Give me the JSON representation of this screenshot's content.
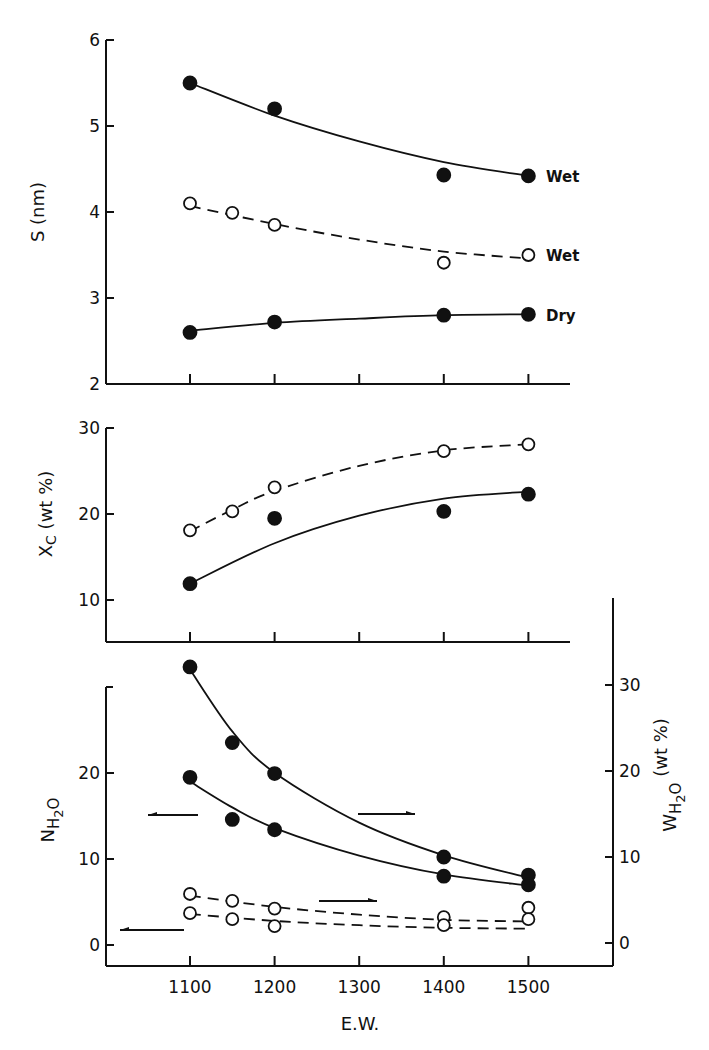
{
  "chart_data": [
    {
      "id": "panel-s",
      "type": "scatter",
      "title": "",
      "xlabel": "",
      "ylabel": "S (nm)",
      "xlim": [
        1000,
        1570
      ],
      "ylim": [
        2,
        6
      ],
      "x_ticks": [
        1100,
        1200,
        1300,
        1400,
        1500
      ],
      "y_ticks": [
        2,
        3,
        4,
        5,
        6
      ],
      "grid": false,
      "legend": "inline labels at right end of curves",
      "series": [
        {
          "name": "Wet (filled)",
          "label": "Wet",
          "marker": "filled-circle",
          "line": "solid",
          "x": [
            1100,
            1200,
            1400,
            1500
          ],
          "y": [
            5.5,
            5.2,
            4.43,
            4.42
          ],
          "fit": [
            [
              1100,
              5.5
            ],
            [
              1200,
              5.12
            ],
            [
              1300,
              4.82
            ],
            [
              1400,
              4.58
            ],
            [
              1500,
              4.42
            ]
          ]
        },
        {
          "name": "Wet (open)",
          "label": "Wet",
          "marker": "open-circle",
          "line": "dashed",
          "x": [
            1100,
            1150,
            1200,
            1400,
            1500
          ],
          "y": [
            4.1,
            3.99,
            3.85,
            3.41,
            3.5
          ],
          "fit": [
            [
              1100,
              4.07
            ],
            [
              1200,
              3.86
            ],
            [
              1300,
              3.68
            ],
            [
              1400,
              3.54
            ],
            [
              1500,
              3.46
            ]
          ]
        },
        {
          "name": "Dry",
          "label": "Dry",
          "marker": "filled-circle",
          "line": "solid",
          "x": [
            1100,
            1200,
            1400,
            1500
          ],
          "y": [
            2.6,
            2.72,
            2.8,
            2.81
          ],
          "fit": [
            [
              1100,
              2.62
            ],
            [
              1200,
              2.71
            ],
            [
              1300,
              2.76
            ],
            [
              1400,
              2.8
            ],
            [
              1500,
              2.81
            ]
          ]
        }
      ]
    },
    {
      "id": "panel-xc",
      "type": "scatter",
      "title": "",
      "xlabel": "",
      "ylabel": "Xc (wt %)",
      "xlim": [
        1000,
        1570
      ],
      "ylim": [
        5,
        30
      ],
      "x_ticks": [
        1100,
        1200,
        1300,
        1400,
        1500
      ],
      "y_ticks": [
        10,
        20,
        30
      ],
      "grid": false,
      "series": [
        {
          "name": "open circles",
          "marker": "open-circle",
          "line": "dashed",
          "x": [
            1100,
            1150,
            1200,
            1400,
            1500
          ],
          "y": [
            18.1,
            20.3,
            23.1,
            27.3,
            28.1
          ],
          "fit": [
            [
              1100,
              18.0
            ],
            [
              1150,
              20.5
            ],
            [
              1200,
              22.7
            ],
            [
              1300,
              25.6
            ],
            [
              1400,
              27.4
            ],
            [
              1500,
              28.1
            ]
          ]
        },
        {
          "name": "filled circles",
          "marker": "filled-circle",
          "line": "solid",
          "x": [
            1100,
            1200,
            1400,
            1500
          ],
          "y": [
            11.9,
            19.5,
            20.3,
            22.3
          ],
          "fit": [
            [
              1100,
              11.9
            ],
            [
              1200,
              16.6
            ],
            [
              1300,
              19.8
            ],
            [
              1400,
              21.8
            ],
            [
              1500,
              22.6
            ]
          ]
        }
      ]
    },
    {
      "id": "panel-water",
      "type": "scatter",
      "title": "",
      "xlabel": "E.W.",
      "ylabel": "N H2O",
      "ylabel_right": "W H2O (wt %)",
      "xlim": [
        1000,
        1600
      ],
      "ylim": [
        -2.5,
        30
      ],
      "ylim_right": [
        -2.5,
        40
      ],
      "x_ticks": [
        1100,
        1200,
        1300,
        1400,
        1500
      ],
      "x_tick_labels": [
        "1100",
        "1200",
        "1300",
        "1400",
        "1500"
      ],
      "y_ticks": [
        0,
        10,
        20
      ],
      "y_ticks_right": [
        0,
        10,
        20,
        30
      ],
      "grid": false,
      "annotations": [
        {
          "type": "arrow",
          "direction": "left",
          "meaning": "N H2O axis (filled lower curve)",
          "x1": 198,
          "x2": 148,
          "y": 815
        },
        {
          "type": "arrow",
          "direction": "right",
          "meaning": "W H2O axis (filled upper curve)",
          "x1": 358,
          "x2": 415,
          "y": 814
        },
        {
          "type": "arrow",
          "direction": "right",
          "meaning": "W H2O axis (open upper curve)",
          "x1": 319,
          "x2": 377,
          "y": 901
        },
        {
          "type": "arrow",
          "direction": "left",
          "meaning": "N H2O axis (open lower curve)",
          "x1": 184,
          "x2": 120,
          "y": 930
        }
      ],
      "series": [
        {
          "name": "W H2O filled",
          "axis": "right",
          "marker": "filled-circle",
          "line": "solid",
          "x": [
            1100,
            1150,
            1200,
            1400,
            1500
          ],
          "y": [
            32.1,
            23.3,
            19.7,
            10.0,
            7.9
          ],
          "fit": [
            [
              1100,
              31.8
            ],
            [
              1150,
              24.6
            ],
            [
              1200,
              19.8
            ],
            [
              1300,
              14.0
            ],
            [
              1400,
              10.2
            ],
            [
              1500,
              7.6
            ]
          ]
        },
        {
          "name": "N H2O filled",
          "axis": "left",
          "marker": "filled-circle",
          "line": "solid",
          "x": [
            1100,
            1150,
            1200,
            1400,
            1500
          ],
          "y": [
            19.5,
            14.6,
            13.4,
            8.0,
            7.0
          ],
          "fit": [
            [
              1100,
              19.0
            ],
            [
              1150,
              16.0
            ],
            [
              1200,
              13.6
            ],
            [
              1300,
              10.4
            ],
            [
              1400,
              8.2
            ],
            [
              1500,
              6.9
            ]
          ]
        },
        {
          "name": "W H2O open",
          "axis": "right",
          "marker": "open-circle",
          "line": "dashed",
          "x": [
            1100,
            1150,
            1200,
            1400,
            1500
          ],
          "y": [
            5.7,
            4.9,
            4.0,
            3.0,
            4.1
          ],
          "fit": [
            [
              1100,
              5.5
            ],
            [
              1200,
              4.2
            ],
            [
              1300,
              3.3
            ],
            [
              1400,
              2.7
            ],
            [
              1500,
              2.5
            ]
          ]
        },
        {
          "name": "N H2O open",
          "axis": "left",
          "marker": "open-circle",
          "line": "dashed",
          "x": [
            1100,
            1150,
            1200,
            1400,
            1500
          ],
          "y": [
            3.7,
            3.0,
            2.2,
            2.3,
            3.0
          ],
          "fit": [
            [
              1100,
              3.6
            ],
            [
              1200,
              2.8
            ],
            [
              1300,
              2.3
            ],
            [
              1400,
              2.0
            ],
            [
              1500,
              1.9
            ]
          ]
        }
      ]
    }
  ],
  "labels": {
    "panel_s_ylabel": "S (nm)",
    "panel_xc_ylabel_main": "X",
    "panel_xc_ylabel_sub": "C",
    "panel_xc_ylabel_unit": "(wt %)",
    "panel_water_left_main": "N",
    "panel_water_left_sub1": "H",
    "panel_water_left_sub2": "2",
    "panel_water_left_sub3": "O",
    "panel_water_right_main": "W",
    "panel_water_right_sub1": "H",
    "panel_water_right_sub2": "2",
    "panel_water_right_sub3": "O",
    "panel_water_right_unit": "(wt %)",
    "xlabel": "E.W.",
    "series_wet_filled": "Wet",
    "series_wet_open": "Wet",
    "series_dry": "Dry"
  }
}
